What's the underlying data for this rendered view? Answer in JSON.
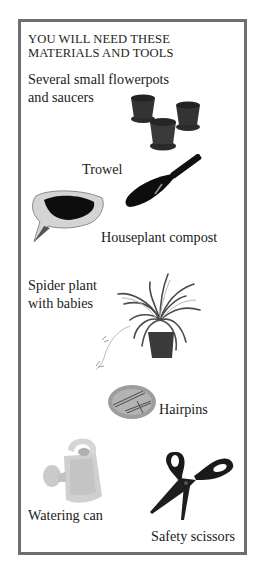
{
  "heading": {
    "line1": "YOU WILL NEED THESE",
    "line2": "MATERIALS AND TOOLS"
  },
  "items": [
    {
      "id": "flowerpots",
      "line1": "Several small flowerpots",
      "line2": "and saucers",
      "icon": "flowerpots-icon"
    },
    {
      "id": "trowel",
      "label": "Trowel",
      "icon": "trowel-icon"
    },
    {
      "id": "compost",
      "label": "Houseplant compost",
      "icon": "compost-bag-icon"
    },
    {
      "id": "spider-plant",
      "line1": "Spider plant",
      "line2": "with babies",
      "icon": "spider-plant-icon"
    },
    {
      "id": "hairpins",
      "label": "Hairpins",
      "icon": "hairpins-dish-icon"
    },
    {
      "id": "watering-can",
      "label": "Watering can",
      "icon": "watering-can-icon"
    },
    {
      "id": "scissors",
      "label": "Safety scissors",
      "icon": "scissors-icon"
    }
  ],
  "colors": {
    "border": "#6e6e6e",
    "text": "#1a1a1a",
    "background": "#ffffff"
  }
}
